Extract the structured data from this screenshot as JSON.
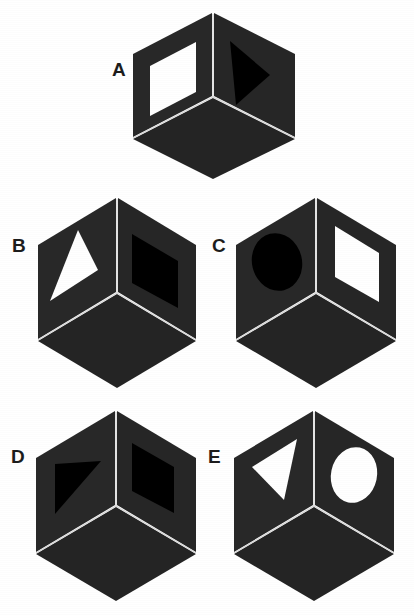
{
  "page": {
    "background_color": "#ffffff",
    "width": 414,
    "height": 615
  },
  "palette": {
    "page_background": "#ffffff",
    "cube_face_left": "#282828",
    "cube_face_right": "#262626",
    "cube_face_top": "#242424",
    "cube_edge_line": "#d9d9d9",
    "shape_black": "#000000",
    "shape_white": "#ffffff",
    "label_color": "#1c1c1c"
  },
  "figures": [
    {
      "id": "cube-a",
      "label": "A",
      "label_x": 112,
      "label_y": 60,
      "cube_x": 133,
      "cube_y": 13,
      "cube_w": 162,
      "cube_h": 166,
      "left_face": {
        "shape": "square",
        "fill": "white"
      },
      "right_face": {
        "shape": "triangle",
        "fill": "black"
      }
    },
    {
      "id": "cube-b",
      "label": "B",
      "label_x": 12,
      "label_y": 236,
      "cube_x": 38,
      "cube_y": 198,
      "cube_w": 158,
      "cube_h": 190,
      "left_face": {
        "shape": "triangle",
        "fill": "white"
      },
      "right_face": {
        "shape": "square",
        "fill": "black"
      }
    },
    {
      "id": "cube-c",
      "label": "C",
      "label_x": 212,
      "label_y": 236,
      "cube_x": 236,
      "cube_y": 198,
      "cube_w": 160,
      "cube_h": 190,
      "left_face": {
        "shape": "circle",
        "fill": "black"
      },
      "right_face": {
        "shape": "square",
        "fill": "white"
      }
    },
    {
      "id": "cube-d",
      "label": "D",
      "label_x": 12,
      "label_y": 446,
      "cube_x": 36,
      "cube_y": 411,
      "cube_w": 160,
      "cube_h": 190,
      "left_face": {
        "shape": "triangle",
        "fill": "black"
      },
      "right_face": {
        "shape": "square",
        "fill": "black"
      }
    },
    {
      "id": "cube-e",
      "label": "E",
      "label_x": 208,
      "label_y": 450,
      "cube_x": 234,
      "cube_y": 411,
      "cube_w": 160,
      "cube_h": 190,
      "left_face": {
        "shape": "triangle",
        "fill": "white"
      },
      "right_face": {
        "shape": "circle",
        "fill": "white"
      }
    }
  ]
}
